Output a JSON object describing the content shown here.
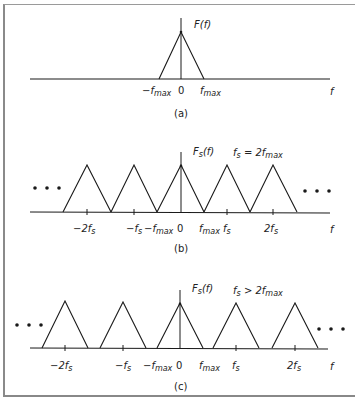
{
  "panels": [
    {
      "id": "a",
      "caption": "(a)",
      "function_label": "F(f)",
      "condition": "",
      "axis_label": "f",
      "ticks": [
        "−f_max",
        "0",
        "f_max"
      ],
      "tick_labels": {
        "neg_fmax": {
          "base": "−f",
          "sub": "max"
        },
        "zero": "0",
        "fmax": {
          "base": "f",
          "sub": "max"
        }
      }
    },
    {
      "id": "b",
      "caption": "(b)",
      "function_label": {
        "base": "F",
        "sub": "s",
        "rest": "(f)"
      },
      "condition": {
        "lhs_base": "f",
        "lhs_sub": "s",
        "op": "=",
        "rhs_base": "2f",
        "rhs_sub": "max"
      },
      "axis_label": "f",
      "ellipsis": "• • •",
      "tick_labels": {
        "neg_2fs": {
          "base": "−2f",
          "sub": "s"
        },
        "neg_fs": {
          "base": "−f",
          "sub": "s"
        },
        "neg_fmax": {
          "base": "−f",
          "sub": "max"
        },
        "zero": "0",
        "fmax": {
          "base": "f",
          "sub": "max"
        },
        "fs": {
          "base": "f",
          "sub": "s"
        },
        "two_fs": {
          "base": "2f",
          "sub": "s"
        }
      }
    },
    {
      "id": "c",
      "caption": "(c)",
      "function_label": {
        "base": "F",
        "sub": "s",
        "rest": "(f)"
      },
      "condition": {
        "lhs_base": "f",
        "lhs_sub": "s",
        "op": ">",
        "rhs_base": "2f",
        "rhs_sub": "max"
      },
      "axis_label": "f",
      "ellipsis": "• • •",
      "tick_labels": {
        "neg_2fs": {
          "base": "−2f",
          "sub": "s"
        },
        "neg_fs": {
          "base": "−f",
          "sub": "s"
        },
        "neg_fmax": {
          "base": "−f",
          "sub": "max"
        },
        "zero": "0",
        "fmax": {
          "base": "f",
          "sub": "max"
        },
        "fs": {
          "base": "f",
          "sub": "s"
        },
        "two_fs": {
          "base": "2f",
          "sub": "s"
        }
      }
    }
  ],
  "colors": {
    "line": "#1a1a1a",
    "frame": "#8a8a8a",
    "background": "#ffffff"
  }
}
